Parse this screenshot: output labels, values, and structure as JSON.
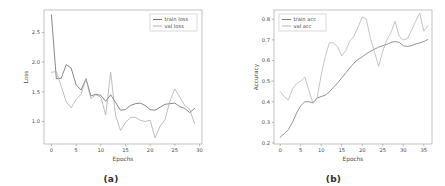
{
  "figure": {
    "background": "#ffffff",
    "panels": [
      {
        "caption": "(a)",
        "name": "loss-panel"
      },
      {
        "caption": "(b)",
        "name": "accuracy-panel"
      }
    ]
  },
  "chart_data": [
    {
      "type": "line",
      "name": "training-loss-chart",
      "title": "",
      "xlabel": "Epochs",
      "ylabel": "Loss",
      "xlim": [
        -1.5,
        30.5
      ],
      "ylim": [
        0.62,
        2.88
      ],
      "xticks": [
        0,
        5,
        10,
        15,
        20,
        25,
        30
      ],
      "yticks": [
        1.0,
        1.5,
        2.0,
        2.5
      ],
      "xticklabels": [
        "0",
        "5",
        "10",
        "15",
        "20",
        "25",
        "30"
      ],
      "yticklabels": [
        "1.0",
        "1.5",
        "2.0",
        "2.5"
      ],
      "grid": false,
      "legend": {
        "position": "upper right",
        "entries": [
          "train loss",
          "val loss"
        ]
      },
      "x": [
        0,
        1,
        2,
        3,
        4,
        5,
        6,
        7,
        8,
        9,
        10,
        11,
        12,
        13,
        14,
        15,
        16,
        17,
        18,
        19,
        20,
        21,
        22,
        23,
        24,
        25,
        26,
        27,
        28,
        29
      ],
      "series": [
        {
          "name": "train loss",
          "color": "#606060",
          "values": [
            2.8,
            1.72,
            1.73,
            1.96,
            1.9,
            1.62,
            1.53,
            1.72,
            1.43,
            1.46,
            1.44,
            1.34,
            1.45,
            1.32,
            1.19,
            1.2,
            1.27,
            1.3,
            1.31,
            1.27,
            1.2,
            1.19,
            1.24,
            1.29,
            1.3,
            1.31,
            1.25,
            1.22,
            1.15,
            1.22
          ]
        },
        {
          "name": "val loss",
          "color": "#a8a8a8",
          "values": [
            1.83,
            1.84,
            1.59,
            1.33,
            1.23,
            1.37,
            1.46,
            1.72,
            1.39,
            1.45,
            1.41,
            1.11,
            1.83,
            1.1,
            0.85,
            0.98,
            1.07,
            1.07,
            1.02,
            1.0,
            1.02,
            0.72,
            0.92,
            1.03,
            1.34,
            1.55,
            1.41,
            1.27,
            1.21,
            0.96
          ]
        }
      ]
    },
    {
      "type": "line",
      "name": "accuracy-chart",
      "title": "",
      "xlabel": "Epochs",
      "ylabel": "Accuracy",
      "xlim": [
        -1.5,
        37.0
      ],
      "ylim": [
        0.195,
        0.845
      ],
      "xticks": [
        0,
        5,
        10,
        15,
        20,
        25,
        30,
        35
      ],
      "yticks": [
        0.2,
        0.3,
        0.4,
        0.5,
        0.6,
        0.7,
        0.8
      ],
      "xticklabels": [
        "0",
        "5",
        "10",
        "15",
        "20",
        "25",
        "30",
        "35"
      ],
      "yticklabels": [
        "0.2",
        "0.3",
        "0.4",
        "0.5",
        "0.6",
        "0.7",
        "0.8"
      ],
      "grid": false,
      "legend": {
        "position": "upper left",
        "entries": [
          "train acc",
          "val acc"
        ]
      },
      "x": [
        0,
        1,
        2,
        3,
        4,
        5,
        6,
        7,
        8,
        9,
        10,
        11,
        12,
        13,
        14,
        15,
        16,
        17,
        18,
        19,
        20,
        21,
        22,
        23,
        24,
        25,
        26,
        27,
        28,
        29,
        30,
        31,
        32,
        33,
        34,
        35,
        36
      ],
      "series": [
        {
          "name": "train acc",
          "color": "#707070",
          "values": [
            0.228,
            0.245,
            0.265,
            0.3,
            0.345,
            0.38,
            0.4,
            0.4,
            0.395,
            0.418,
            0.425,
            0.432,
            0.448,
            0.47,
            0.492,
            0.515,
            0.54,
            0.565,
            0.588,
            0.605,
            0.618,
            0.632,
            0.645,
            0.655,
            0.665,
            0.672,
            0.678,
            0.688,
            0.692,
            0.688,
            0.672,
            0.668,
            0.672,
            0.68,
            0.685,
            0.692,
            0.702
          ]
        },
        {
          "name": "val acc",
          "color": "#b0b0b0",
          "values": [
            0.45,
            0.425,
            0.408,
            0.462,
            0.488,
            0.5,
            0.52,
            0.455,
            0.392,
            0.418,
            0.53,
            0.62,
            0.686,
            0.686,
            0.665,
            0.622,
            0.648,
            0.695,
            0.718,
            0.762,
            0.812,
            0.8,
            0.708,
            0.64,
            0.572,
            0.645,
            0.7,
            0.735,
            0.79,
            0.718,
            0.7,
            0.706,
            0.745,
            0.79,
            0.83,
            0.742,
            0.768
          ]
        }
      ]
    }
  ]
}
